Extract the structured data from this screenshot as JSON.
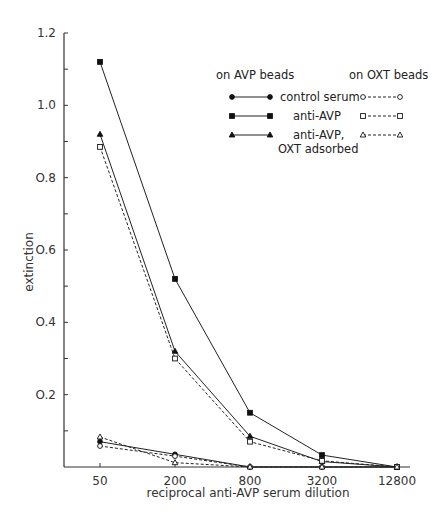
{
  "chart_data": {
    "type": "line",
    "title": "",
    "xlabel": "reciprocal anti-AVP serum dilution",
    "ylabel": "extinction",
    "x_scale": "log",
    "categories": [
      "50",
      "200",
      "800",
      "3200",
      "12800"
    ],
    "x": [
      50,
      200,
      800,
      3200,
      12800
    ],
    "ylim": [
      0,
      1.2
    ],
    "yticks": [
      "0.2",
      "0.4",
      "0.6",
      "0.8",
      "1.0",
      "1.2"
    ],
    "grid": false,
    "legend_position": "upper right",
    "legend_headers": {
      "left": "on AVP beads",
      "right": "on OXT beads"
    },
    "series": [
      {
        "name": "control serum (on AVP beads)",
        "marker": "filled-circle",
        "line": "solid",
        "values": [
          0.07,
          0.035,
          0.0,
          0.0,
          0.0
        ]
      },
      {
        "name": "anti-AVP (on AVP beads)",
        "marker": "filled-square",
        "line": "solid",
        "values": [
          1.12,
          0.52,
          0.15,
          0.033,
          0.0
        ]
      },
      {
        "name": "anti-AVP, OXT adsorbed (on AVP beads)",
        "marker": "filled-triangle",
        "line": "solid",
        "values": [
          0.92,
          0.32,
          0.085,
          0.015,
          0.0
        ]
      },
      {
        "name": "control serum (on OXT beads)",
        "marker": "open-circle",
        "line": "dashed",
        "values": [
          0.058,
          0.03,
          0.0,
          0.0,
          0.0
        ]
      },
      {
        "name": "anti-AVP (on OXT beads)",
        "marker": "open-square",
        "line": "dashed",
        "values": [
          0.885,
          0.3,
          0.07,
          0.017,
          0.0
        ]
      },
      {
        "name": "anti-AVP, OXT adsorbed (on OXT beads)",
        "marker": "open-triangle",
        "line": "dashed",
        "values": [
          0.083,
          0.012,
          0.0,
          0.0,
          0.0
        ]
      }
    ]
  },
  "legend": {
    "header_left": "on AVP beads",
    "header_right": "on OXT beads",
    "rows": [
      {
        "label": "control serum"
      },
      {
        "label": "anti-AVP"
      },
      {
        "label": "anti-AVP,",
        "label2": "OXT adsorbed"
      }
    ]
  },
  "axes": {
    "xlabel": "reciprocal anti-AVP serum dilution",
    "ylabel": "extinction"
  }
}
